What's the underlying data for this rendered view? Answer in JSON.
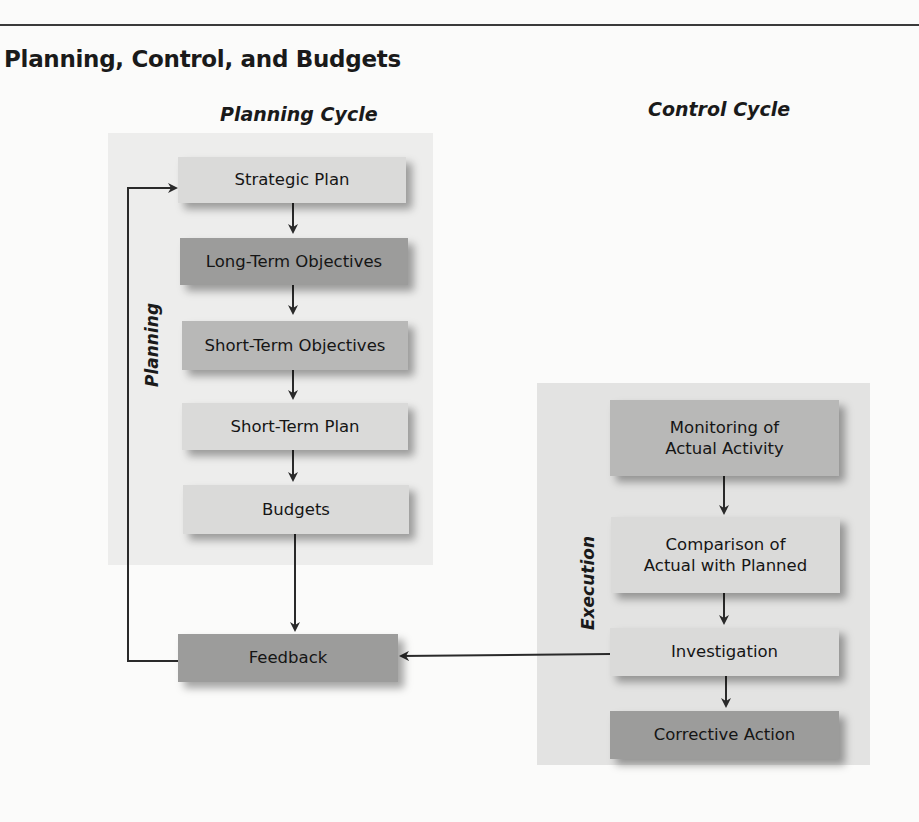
{
  "figure": {
    "title": "Planning, Control, and Budgets",
    "planning_cycle": {
      "heading": "Planning Cycle",
      "side_label": "Planning",
      "steps": [
        {
          "label": "Strategic Plan",
          "shade": "light"
        },
        {
          "label": "Long-Term Objectives",
          "shade": "dark"
        },
        {
          "label": "Short-Term Objectives",
          "shade": "mid"
        },
        {
          "label": "Short-Term Plan",
          "shade": "light"
        },
        {
          "label": "Budgets",
          "shade": "light"
        }
      ],
      "feedback": {
        "label": "Feedback",
        "shade": "dark"
      }
    },
    "control_cycle": {
      "heading": "Control Cycle",
      "side_label": "Execution",
      "steps": [
        {
          "label_line1": "Monitoring of",
          "label_line2": "Actual Activity",
          "shade": "mid"
        },
        {
          "label_line1": "Comparison of",
          "label_line2": "Actual with Planned",
          "shade": "light"
        },
        {
          "label": "Investigation",
          "shade": "light"
        },
        {
          "label": "Corrective Action",
          "shade": "dark"
        }
      ]
    },
    "colors": {
      "light_box": "#dadad9",
      "mid_box": "#b8b8b7",
      "dark_box": "#9c9c9b",
      "panel_bg": "#ededec",
      "control_panel_bg": "#e3e3e2",
      "line": "#2a2a2a"
    }
  }
}
